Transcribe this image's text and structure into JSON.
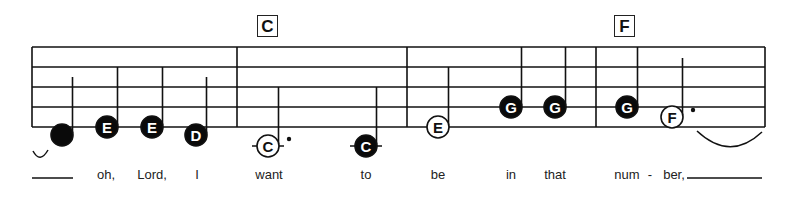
{
  "staff": {
    "left": 32,
    "right": 765,
    "lines_y": [
      47,
      67,
      87,
      107,
      127
    ],
    "barlines_x": [
      32,
      237,
      407,
      596,
      765
    ]
  },
  "chords": [
    {
      "label": "C",
      "x": 257,
      "y": 15
    },
    {
      "label": "F",
      "x": 614,
      "y": 15
    }
  ],
  "notes": [
    {
      "letter": "",
      "x": 62,
      "y": 135,
      "r": 11,
      "filled": true,
      "stem_top": 77,
      "stem_side": "right",
      "ledger": false,
      "dot": false
    },
    {
      "letter": "E",
      "x": 107,
      "y": 127,
      "r": 11,
      "filled": true,
      "stem_top": 67,
      "stem_side": "right",
      "ledger": false,
      "dot": false
    },
    {
      "letter": "E",
      "x": 152,
      "y": 127,
      "r": 11,
      "filled": true,
      "stem_top": 67,
      "stem_side": "right",
      "ledger": false,
      "dot": false
    },
    {
      "letter": "D",
      "x": 196,
      "y": 135,
      "r": 11,
      "filled": true,
      "stem_top": 77,
      "stem_side": "right",
      "ledger": false,
      "dot": false
    },
    {
      "letter": "C",
      "x": 268,
      "y": 146,
      "r": 11,
      "filled": false,
      "stem_top": 87,
      "stem_side": "right",
      "ledger": true,
      "dot": true
    },
    {
      "letter": "C",
      "x": 366,
      "y": 146,
      "r": 11,
      "filled": true,
      "stem_top": 87,
      "stem_side": "right",
      "ledger": true,
      "dot": false
    },
    {
      "letter": "E",
      "x": 438,
      "y": 127,
      "r": 11,
      "filled": false,
      "stem_top": 67,
      "stem_side": "right",
      "ledger": false,
      "dot": false
    },
    {
      "letter": "G",
      "x": 511,
      "y": 107,
      "r": 11,
      "filled": true,
      "stem_top": 47,
      "stem_side": "right",
      "ledger": false,
      "dot": false
    },
    {
      "letter": "G",
      "x": 555,
      "y": 107,
      "r": 11,
      "filled": true,
      "stem_top": 47,
      "stem_side": "right",
      "ledger": false,
      "dot": false
    },
    {
      "letter": "G",
      "x": 627,
      "y": 107,
      "r": 11,
      "filled": true,
      "stem_top": 47,
      "stem_side": "right",
      "ledger": false,
      "dot": false
    },
    {
      "letter": "F",
      "x": 672,
      "y": 117,
      "r": 11,
      "filled": false,
      "stem_top": 58,
      "stem_side": "right",
      "ledger": false,
      "dot": true
    }
  ],
  "ties": [
    {
      "d": "M 33 151 Q 40 164 48 150"
    },
    {
      "d": "M 697 131 Q 730 162 762 132"
    }
  ],
  "lyrics": [
    {
      "text": "oh,",
      "x": 106
    },
    {
      "text": "Lord,",
      "x": 152
    },
    {
      "text": "I",
      "x": 197
    },
    {
      "text": "want",
      "x": 269
    },
    {
      "text": "to",
      "x": 366
    },
    {
      "text": "be",
      "x": 438
    },
    {
      "text": "in",
      "x": 511
    },
    {
      "text": "that",
      "x": 555
    },
    {
      "text": "num",
      "x": 627
    },
    {
      "text": "-",
      "x": 650
    },
    {
      "text": "ber,",
      "x": 674
    }
  ],
  "extenders": [
    {
      "x1": 32,
      "x2": 73,
      "y": 178
    },
    {
      "x1": 687,
      "x2": 762,
      "y": 178
    }
  ],
  "colors": {
    "ink": "#111111",
    "paper": "#ffffff",
    "note_fill": "#0a0a0a",
    "note_letter_on_fill": "#ffffff"
  }
}
